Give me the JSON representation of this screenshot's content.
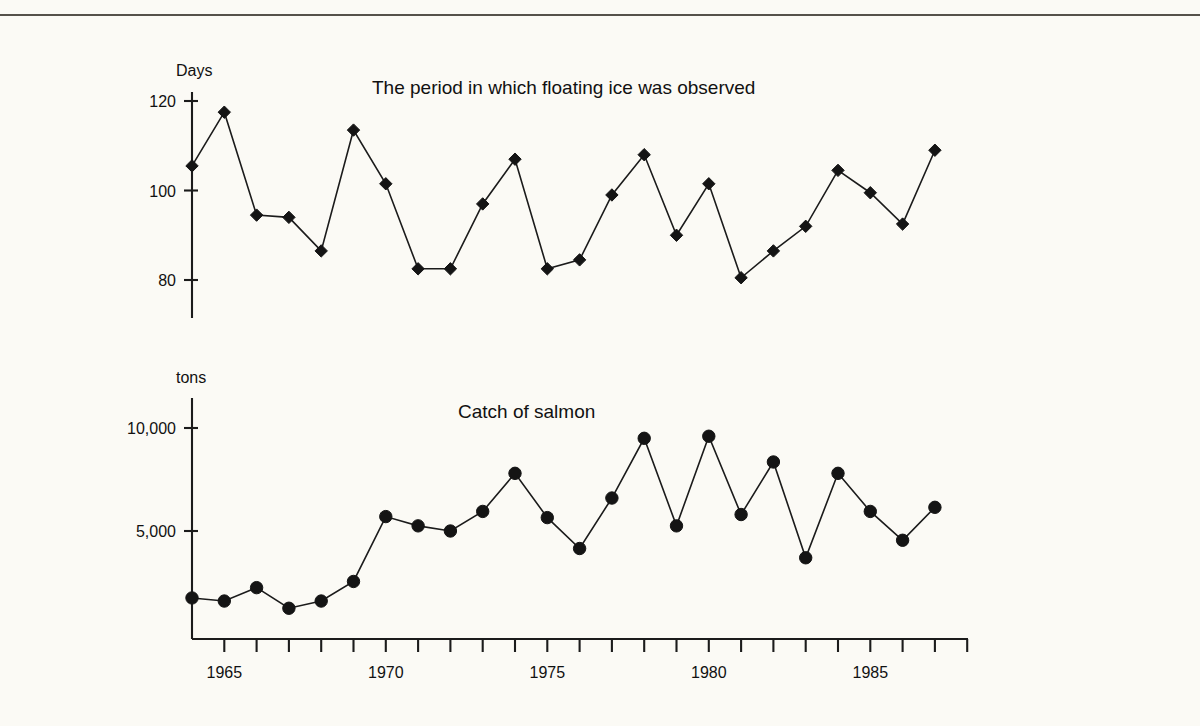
{
  "page": {
    "background_color": "#fbfaf5",
    "ink_color": "#1a1a1a",
    "rule_color": "#55514a"
  },
  "chart_data": [
    {
      "type": "line",
      "id": "floating-ice",
      "title": "The period in which floating ice was observed",
      "xlabel": "",
      "ylabel": "Days",
      "ylim": [
        70,
        125
      ],
      "yticks": [
        80,
        100,
        120
      ],
      "ytick_labels": [
        "80",
        "100",
        "120"
      ],
      "xlim": [
        1964,
        1988
      ],
      "xticks": [
        1965,
        1970,
        1975,
        1980,
        1985
      ],
      "xtick_labels": [
        "1965",
        "1970",
        "1975",
        "1980",
        "1985"
      ],
      "grid": false,
      "legend": "none",
      "marker": "diamond",
      "x": [
        1964,
        1965,
        1966,
        1967,
        1968,
        1969,
        1970,
        1971,
        1972,
        1973,
        1974,
        1975,
        1976,
        1977,
        1978,
        1979,
        1980,
        1981,
        1982,
        1983,
        1984,
        1985,
        1986,
        1987,
        1988
      ],
      "values": [
        105.5,
        117.5,
        94.5,
        94.0,
        86.5,
        113.5,
        101.5,
        82.5,
        82.5,
        97.0,
        107.0,
        82.5,
        84.5,
        99.0,
        108.0,
        90.0,
        101.5,
        80.5,
        86.5,
        92.0,
        104.5,
        99.5,
        92.5,
        109.0
      ],
      "note": "values align to x starting at 1965; the first plotted point sits on the axis at 1964"
    },
    {
      "type": "line",
      "id": "salmon-catch",
      "title": "Catch of salmon",
      "xlabel": "",
      "ylabel": "tons",
      "ylim": [
        0,
        11500
      ],
      "yticks": [
        5000,
        10000
      ],
      "ytick_labels": [
        "5,000",
        "10,000"
      ],
      "xlim": [
        1964,
        1988
      ],
      "xticks": [
        1965,
        1970,
        1975,
        1980,
        1985
      ],
      "xtick_labels": [
        "1965",
        "1970",
        "1975",
        "1980",
        "1985"
      ],
      "grid": false,
      "legend": "none",
      "marker": "circle",
      "x": [
        1964,
        1965,
        1966,
        1967,
        1968,
        1969,
        1970,
        1971,
        1972,
        1973,
        1974,
        1975,
        1976,
        1977,
        1978,
        1979,
        1980,
        1981,
        1982,
        1983,
        1984,
        1985,
        1986,
        1987,
        1988
      ],
      "values": [
        1750,
        1600,
        2250,
        1250,
        1600,
        2550,
        5700,
        5250,
        5000,
        5950,
        7800,
        5650,
        4150,
        6600,
        9500,
        5250,
        9600,
        5800,
        8350,
        3700,
        7800,
        5950,
        4550,
        6150
      ]
    }
  ]
}
